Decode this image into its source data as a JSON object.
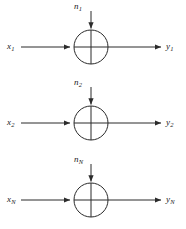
{
  "diagram": {
    "type": "parallel-additive-noise-channels",
    "channel_count": 3,
    "stroke_color": "#2b2b2b",
    "background_color": "#ffffff",
    "junction": {
      "shape": "circle-with-cross",
      "radius": 17,
      "center_x": 91
    },
    "channels": [
      {
        "id": "channel-1",
        "input_label": "x",
        "input_sub": "1",
        "noise_label": "n",
        "noise_sub": "1",
        "output_label": "y",
        "output_sub": "1"
      },
      {
        "id": "channel-2",
        "input_label": "x",
        "input_sub": "2",
        "noise_label": "n",
        "noise_sub": "2",
        "output_label": "y",
        "output_sub": "2"
      },
      {
        "id": "channel-N",
        "input_label": "x",
        "input_sub": "N",
        "noise_label": "n",
        "noise_sub": "N",
        "output_label": "y",
        "output_sub": "N"
      }
    ]
  }
}
